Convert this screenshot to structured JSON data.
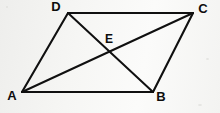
{
  "figure": {
    "kind": "geometry-diagram",
    "shape_name": "parallelogram",
    "background_color": "#f4f4f2",
    "ink_color": "#101010",
    "canvas": {
      "width": 220,
      "height": 113
    },
    "vertices": [
      {
        "id": "A",
        "label": "A",
        "x": 22,
        "y": 92,
        "label_x": 12,
        "label_y": 97
      },
      {
        "id": "B",
        "label": "B",
        "x": 153,
        "y": 92,
        "label_x": 161,
        "label_y": 98
      },
      {
        "id": "C",
        "label": "C",
        "x": 193,
        "y": 13,
        "label_x": 203,
        "label_y": 10
      },
      {
        "id": "D",
        "label": "D",
        "x": 68,
        "y": 13,
        "label_x": 56,
        "label_y": 8
      }
    ],
    "points": [
      {
        "id": "E",
        "label": "E",
        "x": 108,
        "y": 56,
        "label_x": 109,
        "label_y": 40,
        "description": "intersection of diagonals"
      }
    ],
    "edges": [
      {
        "id": "AB",
        "from": "A",
        "to": "B",
        "name": "side-ab"
      },
      {
        "id": "BC",
        "from": "B",
        "to": "C",
        "name": "side-bc"
      },
      {
        "id": "CD",
        "from": "C",
        "to": "D",
        "name": "side-cd"
      },
      {
        "id": "DA",
        "from": "D",
        "to": "A",
        "name": "side-da"
      }
    ],
    "diagonals": [
      {
        "id": "AC",
        "from": "A",
        "to": "C",
        "name": "diagonal-ac"
      },
      {
        "id": "BD",
        "from": "B",
        "to": "D",
        "name": "diagonal-bd"
      }
    ]
  }
}
